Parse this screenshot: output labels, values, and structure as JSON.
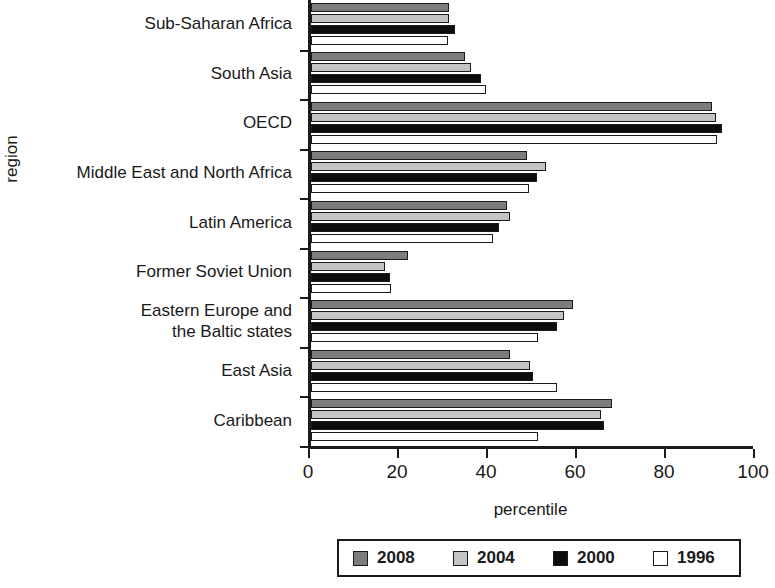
{
  "chart_data": {
    "type": "bar",
    "orientation": "horizontal",
    "title": "",
    "xlabel": "percentile",
    "ylabel": "region",
    "xlim": [
      0,
      100
    ],
    "xticks": [
      "0",
      "20",
      "40",
      "60",
      "80",
      "100"
    ],
    "grid": false,
    "legend_position": "bottom-right",
    "categories": [
      "Sub-Saharan Africa",
      "South Asia",
      "OECD",
      "Middle East and North Africa",
      "Latin America",
      "Former Soviet Union",
      "Eastern Europe and\nthe Baltic states",
      "East Asia",
      "Caribbean"
    ],
    "series": [
      {
        "name": "2008",
        "color": "#7d7d7d",
        "values": [
          31.0,
          34.7,
          90.0,
          48.6,
          44.0,
          21.8,
          58.8,
          44.8,
          67.6
        ]
      },
      {
        "name": "2004",
        "color": "#c4c4c4",
        "values": [
          31.0,
          36.0,
          91.0,
          52.9,
          44.8,
          16.6,
          56.8,
          49.3,
          65.1
        ]
      },
      {
        "name": "2000",
        "color": "#0d0d0d",
        "values": [
          32.4,
          38.3,
          92.3,
          50.7,
          42.3,
          17.8,
          55.2,
          49.8,
          65.8
        ]
      },
      {
        "name": "1996",
        "color": "#ffffff",
        "values": [
          30.8,
          39.4,
          91.2,
          48.9,
          41.0,
          18.0,
          51.1,
          55.2,
          51.1
        ]
      }
    ]
  },
  "legend": {
    "entries": [
      {
        "label": "2008",
        "swatch": "dark-gray"
      },
      {
        "label": "2004",
        "swatch": "light-gray"
      },
      {
        "label": "2000",
        "swatch": "black"
      },
      {
        "label": "1996",
        "swatch": "white"
      }
    ]
  }
}
